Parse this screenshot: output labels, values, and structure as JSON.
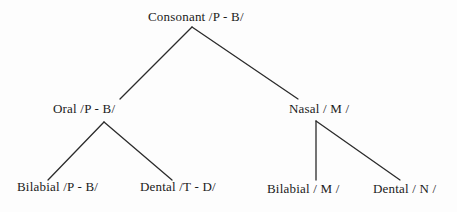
{
  "diagram": {
    "type": "tree",
    "background_color": "#fdfdfd",
    "line_color": "#2b2b2b",
    "text_color": "#1b1b1b",
    "nodes": {
      "root": "Consonant /P - B/",
      "oral": "Oral /P - B/",
      "nasal": "Nasal / M /",
      "oral_bilabial": "Bilabial /P - B/",
      "oral_dental": "Dental /T - D/",
      "nasal_bilabial": "Bilabial / M /",
      "nasal_dental": "Dental / N /"
    },
    "edges": [
      {
        "from": "root",
        "to": "oral",
        "x1": 192,
        "y1": 27,
        "x2": 120,
        "y2": 99
      },
      {
        "from": "root",
        "to": "nasal",
        "x1": 192,
        "y1": 27,
        "x2": 298,
        "y2": 99
      },
      {
        "from": "oral",
        "to": "oral_bilabial",
        "x1": 104,
        "y1": 122,
        "x2": 48,
        "y2": 180
      },
      {
        "from": "oral",
        "to": "oral_dental",
        "x1": 104,
        "y1": 122,
        "x2": 172,
        "y2": 180
      },
      {
        "from": "nasal",
        "to": "nasal_bilabial",
        "x1": 316,
        "y1": 121,
        "x2": 316,
        "y2": 180
      },
      {
        "from": "nasal",
        "to": "nasal_dental",
        "x1": 316,
        "y1": 121,
        "x2": 400,
        "y2": 180
      }
    ]
  }
}
